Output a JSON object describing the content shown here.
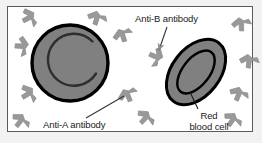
{
  "figure": {
    "background_color": "#f2f2f2",
    "panel_color": "#ffffff",
    "border_color": "#5a5a5a"
  },
  "labels": {
    "anti_b": "Anti-B antibody",
    "anti_a": "Anti-A antibody",
    "red_blood_cell_line1": "Red",
    "red_blood_cell_line2": "blood cell"
  },
  "colors": {
    "cell_fill": "#808080",
    "cell_outline": "#000000",
    "antibody_fill": "#999999",
    "antibody_outline": "#8a8a8a",
    "leader_line": "#333333",
    "text": "#1a1a1a"
  },
  "cells": [
    {
      "name": "round-red-blood-cell",
      "shape": "circle",
      "cx": 70,
      "cy": 63,
      "r": 39,
      "inner_detail": "crescent-arc"
    },
    {
      "name": "tilted-red-blood-cell",
      "shape": "ellipse",
      "cx": 196,
      "cy": 72,
      "rx": 37,
      "ry": 24,
      "rotation_deg": -52,
      "inner_detail": "concentric-ellipse"
    }
  ],
  "antibodies": [
    {
      "name": "antibody-1",
      "x": 30,
      "y": 17,
      "rotation_deg": 205
    },
    {
      "name": "antibody-2",
      "x": 97,
      "y": 17,
      "rotation_deg": 160
    },
    {
      "name": "antibody-3",
      "x": 23,
      "y": 46,
      "rotation_deg": 235
    },
    {
      "name": "antibody-4",
      "x": 122,
      "y": 34,
      "rotation_deg": 125
    },
    {
      "name": "antibody-5",
      "x": 241,
      "y": 23,
      "rotation_deg": 140
    },
    {
      "name": "antibody-6",
      "x": 157,
      "y": 57,
      "rotation_deg": 255
    },
    {
      "name": "antibody-7",
      "x": 29,
      "y": 93,
      "rotation_deg": 200
    },
    {
      "name": "antibody-8",
      "x": 21,
      "y": 120,
      "rotation_deg": 180
    },
    {
      "name": "antibody-9",
      "x": 127,
      "y": 94,
      "rotation_deg": 120
    },
    {
      "name": "antibody-10",
      "x": 239,
      "y": 93,
      "rotation_deg": 165
    },
    {
      "name": "antibody-11",
      "x": 146,
      "y": 117,
      "rotation_deg": 185
    },
    {
      "name": "antibody-12",
      "x": 233,
      "y": 119,
      "rotation_deg": 178
    },
    {
      "name": "antibody-13",
      "x": 249,
      "y": 60,
      "rotation_deg": 150
    }
  ],
  "leader_lines": [
    {
      "name": "anti-b-leader",
      "x1": 167,
      "y1": 27,
      "x2": 158,
      "y2": 52,
      "arrow": true
    },
    {
      "name": "anti-a-leader",
      "x1": 86,
      "y1": 118,
      "x2": 124,
      "y2": 96,
      "arrow": false
    },
    {
      "name": "rbc-leader",
      "x1": 198,
      "y1": 109,
      "x2": 190,
      "y2": 92,
      "arrow": false
    }
  ]
}
